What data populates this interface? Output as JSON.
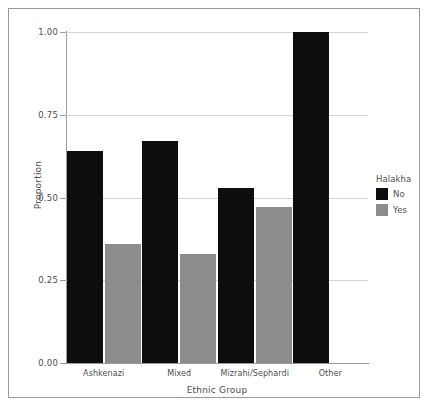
{
  "chart_data": {
    "type": "bar",
    "title": "",
    "xlabel": "Ethnic Group",
    "ylabel": "Proportion",
    "categories": [
      "Ashkenazi",
      "Mixed",
      "Mizrahi/Sephardi",
      "Other"
    ],
    "series": [
      {
        "name": "No",
        "color": "#0d0d0d",
        "values": [
          0.64,
          0.67,
          0.53,
          1.0
        ]
      },
      {
        "name": "Yes",
        "color": "#8c8c8c",
        "values": [
          0.36,
          0.33,
          0.47,
          null
        ]
      }
    ],
    "legend": {
      "title": "Halakha",
      "position": "right",
      "entries": [
        {
          "label": "No",
          "color": "#0d0d0d"
        },
        {
          "label": "Yes",
          "color": "#8c8c8c"
        }
      ]
    },
    "ylim": [
      0.0,
      1.0
    ],
    "yticks": [
      0.0,
      0.25,
      0.5,
      0.75,
      1.0
    ],
    "ytick_labels": [
      "0.00",
      "0.25",
      "0.50",
      "0.75",
      "1.00"
    ],
    "grid": {
      "horizontal": true,
      "vertical": false,
      "color": "#d4d4d4"
    },
    "frame_color": "#9a9a9a",
    "background": "#ffffff",
    "bar_group_mode": "dodge"
  }
}
